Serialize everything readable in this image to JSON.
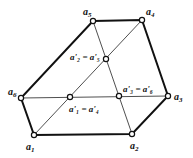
{
  "diagram": {
    "vertices": [
      {
        "id": "a1",
        "label": "a",
        "sub": "1",
        "x": 34,
        "y": 135,
        "lx": 26,
        "ly": 150
      },
      {
        "id": "a2",
        "label": "a",
        "sub": "2",
        "x": 132,
        "y": 134,
        "lx": 130,
        "ly": 149
      },
      {
        "id": "a3",
        "label": "a",
        "sub": "3",
        "x": 168,
        "y": 96,
        "lx": 174,
        "ly": 100
      },
      {
        "id": "a4",
        "label": "a",
        "sub": "4",
        "x": 142,
        "y": 20,
        "lx": 146,
        "ly": 15
      },
      {
        "id": "a5",
        "label": "a",
        "sub": "5",
        "x": 93,
        "y": 21,
        "lx": 83,
        "ly": 15
      },
      {
        "id": "a6",
        "label": "a",
        "sub": "6",
        "x": 21,
        "y": 98,
        "lx": 8,
        "ly": 95
      }
    ],
    "midpoints": [
      {
        "id": "p25",
        "text": "a'₂ = a'₅",
        "x": 106,
        "y": 59,
        "lx": 70,
        "ly": 60
      },
      {
        "id": "p14",
        "text": "a'₁ = a'₄",
        "x": 70,
        "y": 97,
        "lx": 69,
        "ly": 112
      },
      {
        "id": "p36",
        "text": "a'₃ = a'₆",
        "x": 119,
        "y": 96,
        "lx": 123,
        "ly": 92
      }
    ],
    "polygon_edges": [
      [
        "a1",
        "a2"
      ],
      [
        "a2",
        "a3"
      ],
      [
        "a3",
        "a4"
      ],
      [
        "a4",
        "a5"
      ],
      [
        "a5",
        "a6"
      ],
      [
        "a6",
        "a1"
      ]
    ],
    "diagonals": [
      [
        "a1",
        "a4"
      ],
      [
        "a2",
        "a5"
      ],
      [
        "a3",
        "a6"
      ]
    ]
  }
}
